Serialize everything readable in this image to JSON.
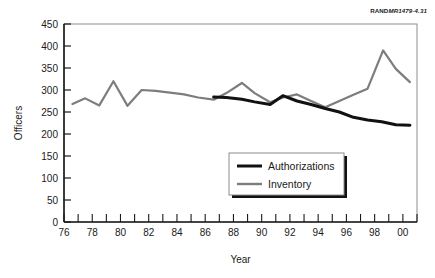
{
  "figure": {
    "credit_brand": "RAND",
    "credit_code": "MR1479-4.31"
  },
  "chart_data": {
    "type": "line",
    "title": "",
    "xlabel": "Year",
    "ylabel": "Officers",
    "xlim": [
      1976,
      2001
    ],
    "ylim": [
      0,
      450
    ],
    "ytick_step": 50,
    "xtick_step": 1,
    "xticklabel_step": 2,
    "grid": false,
    "legend_position": "inside-lower-center",
    "yticks": [
      0,
      50,
      100,
      150,
      200,
      250,
      300,
      350,
      400,
      450
    ],
    "ytick_labels": [
      "0",
      "50",
      "100",
      "150",
      "200",
      "250",
      "300",
      "350",
      "400",
      "450"
    ],
    "xticks": [
      1976,
      1977,
      1978,
      1979,
      1980,
      1981,
      1982,
      1983,
      1984,
      1985,
      1986,
      1987,
      1988,
      1989,
      1990,
      1991,
      1992,
      1993,
      1994,
      1995,
      1996,
      1997,
      1998,
      1999,
      2000,
      2001
    ],
    "xtick_labels": [
      "76",
      "",
      "78",
      "",
      "80",
      "",
      "82",
      "",
      "84",
      "",
      "86",
      "",
      "88",
      "",
      "90",
      "",
      "92",
      "",
      "94",
      "",
      "96",
      "",
      "98",
      "",
      "00",
      ""
    ],
    "series": [
      {
        "name": "Authorizations",
        "color": "#111111",
        "width": 3.0,
        "x": [
          1986.6,
          1987.5,
          1988.6,
          1989.5,
          1990.6,
          1991.5,
          1992.5,
          1993.5,
          1994.5,
          1995.5,
          1996.5,
          1997.5,
          1998.5,
          1999.5,
          2000.5
        ],
        "values": [
          284,
          283,
          279,
          273,
          267,
          287,
          275,
          267,
          258,
          250,
          238,
          232,
          228,
          221,
          220
        ]
      },
      {
        "name": "Inventory",
        "color": "#7d7d7d",
        "width": 2.2,
        "x": [
          1976.6,
          1977.5,
          1978.5,
          1979.5,
          1980.5,
          1981.5,
          1982.5,
          1983.5,
          1984.5,
          1985.5,
          1986.6,
          1987.5,
          1988.6,
          1989.5,
          1990.6,
          1991.5,
          1992.5,
          1993.5,
          1994.5,
          1995.5,
          1996.5,
          1997.5,
          1998.6,
          1999.5,
          2000.5
        ],
        "values": [
          268,
          281,
          265,
          320,
          264,
          300,
          298,
          294,
          290,
          283,
          278,
          293,
          316,
          293,
          272,
          283,
          290,
          275,
          261,
          275,
          289,
          303,
          390,
          348,
          318
        ]
      }
    ],
    "legend": [
      {
        "label": "Authorizations",
        "color": "#111111"
      },
      {
        "label": "Inventory",
        "color": "#7d7d7d"
      }
    ]
  }
}
